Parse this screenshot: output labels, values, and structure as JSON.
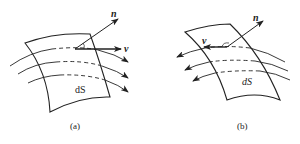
{
  "figures": [
    {
      "id": "a",
      "caption": "(a)",
      "surface_label": "dS",
      "normal_label": "n",
      "velocity_label": "v",
      "flow_direction": "right"
    },
    {
      "id": "b",
      "caption": "(b)",
      "surface_label": "dS",
      "normal_label": "n",
      "velocity_label": "v",
      "flow_direction": "left"
    }
  ],
  "colors": {
    "stroke": "#222222",
    "background": "#ffffff"
  }
}
